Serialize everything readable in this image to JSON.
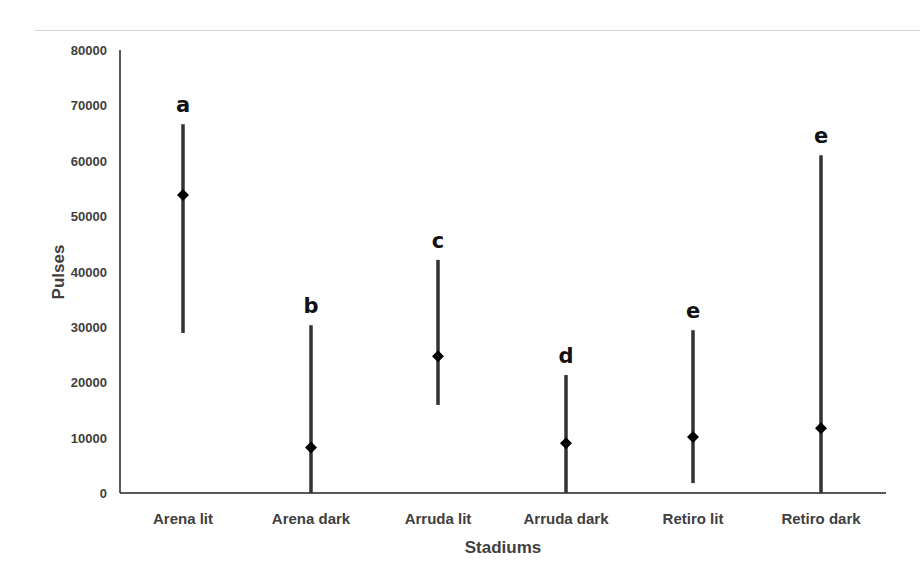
{
  "chart_data": {
    "type": "scatter",
    "title": "",
    "xlabel": "Stadiums",
    "ylabel": "Pulses",
    "ylim": [
      0,
      80000
    ],
    "yticks": [
      0,
      10000,
      20000,
      30000,
      40000,
      50000,
      60000,
      70000,
      80000
    ],
    "grid": false,
    "legend": null,
    "categories": [
      "Arena lit",
      "Arena dark",
      "Arruda lit",
      "Arruda dark",
      "Retiro lit",
      "Retiro dark"
    ],
    "values": [
      53800,
      8200,
      24700,
      9000,
      10100,
      11700
    ],
    "error_upper": [
      66600,
      30300,
      42100,
      21300,
      29400,
      61000
    ],
    "error_lower": [
      28900,
      0,
      15900,
      0,
      1800,
      0
    ],
    "annotations": [
      "a",
      "b",
      "c",
      "d",
      "e",
      "e"
    ],
    "marker": "diamond",
    "color": "#000000",
    "errorbar_color": "#333333"
  }
}
